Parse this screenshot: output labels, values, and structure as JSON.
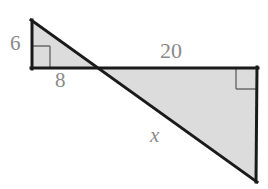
{
  "figure": {
    "canvas": {
      "width": 268,
      "height": 189,
      "background": "#ffffff"
    },
    "style": {
      "stroke_color": "#1a1a1a",
      "fill_color": "#dcdcdc",
      "label_color": "#8a8a8a",
      "right_angle_mark_color": "#6a6a6a",
      "stroke_width": 3,
      "thin_stroke_width": 1.4
    },
    "points": {
      "small_apex": {
        "x": 32,
        "y": 21
      },
      "small_right_angle": {
        "x": 32,
        "y": 68
      },
      "intersection": {
        "x": 96,
        "y": 68
      },
      "large_top_right": {
        "x": 257,
        "y": 68
      },
      "large_bottom_right": {
        "x": 256,
        "y": 181
      }
    },
    "shapes": [
      {
        "name": "small-triangle",
        "vertices": "32,21 32,68 96,68",
        "filled": true
      },
      {
        "name": "large-triangle",
        "vertices": "96,68 257,68 256,181",
        "filled": true
      }
    ],
    "right_angle_marks": [
      {
        "name": "small-right-angle-mark",
        "path": "M 50,46 L 50,68 M 32,46 L 50,46"
      },
      {
        "name": "large-right-angle-mark",
        "path": "M 236,68 L 236,89 M 236,89 L 257,89"
      }
    ],
    "labels": [
      {
        "id": "label-6",
        "name": "side-label-6",
        "text": "6",
        "describes": "vertical leg of small triangle"
      },
      {
        "id": "label-8",
        "name": "side-label-8",
        "text": "8",
        "describes": "horizontal leg of small triangle"
      },
      {
        "id": "label-20",
        "name": "side-label-20",
        "text": "20",
        "describes": "horizontal leg of large triangle"
      },
      {
        "id": "label-x",
        "name": "side-label-x",
        "text": "x",
        "describes": "hypotenuse of large triangle, unknown"
      }
    ]
  },
  "labels": {
    "six": "6",
    "eight": "8",
    "twenty": "20",
    "x": "x"
  }
}
